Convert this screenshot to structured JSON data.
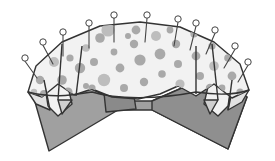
{
  "illustration": {
    "title": "Polka-dot fabric pinned over a folded board",
    "canvas": {
      "width": 275,
      "height": 161,
      "background": "#ffffff"
    },
    "palette": {
      "background": "#ffffff",
      "board_fill": "#a0a0a0",
      "board_shade_fill": "#8f8f8f",
      "cloth_fill": "#f2f2f2",
      "cloth_flap_fill": "#e2e2e2",
      "cloth_flap_dark_fill": "#cfcfcf",
      "dot_fill": "#a9a9a9",
      "dot_fill_light": "#bdbdbd",
      "tag_fill": "#8a8a8a",
      "outline": "#333333",
      "pin_head_fill": "#ffffff",
      "pin_stroke": "#444444"
    },
    "strokes": {
      "outline_width": 1.4,
      "pin_stem_width": 1.1,
      "pin_head_width": 1.0
    },
    "board": {
      "name": "dark-gray-chevron-board",
      "points": "33,95 60,74 117,101 152,101 214,74 247,97 228,149 152,110 118,110 49,151",
      "shade_points": "152,101 214,74 247,97 228,149 152,110"
    },
    "cloth": {
      "name": "polka-dot-cloth",
      "main_points": "28,92 36,66 62,42 100,26 140,22 180,27 214,42 240,64 249,90 232,98 214,84 196,96 178,86 160,94 138,99 112,97 92,89 74,95 58,84 42,97",
      "top_curve": "M 28,92 C 34,62 66,30 138,22 C 206,30 242,62 249,90",
      "hem_path": "M 28,92 C 52,98 66,96 92,92 C 118,100 160,99 196,92 C 222,96 238,94 249,90"
    },
    "flaps": [
      {
        "name": "flap-left-outer",
        "points": "28,92 44,82 50,110 36,104",
        "fill_key": "cloth_flap_fill"
      },
      {
        "name": "flap-left-point",
        "points": "44,80 66,78 72,104 58,116 48,106",
        "fill_key": "cloth_fill"
      },
      {
        "name": "flap-left-shadow",
        "points": "58,100 72,100 62,114",
        "fill_key": "cloth_flap_dark_fill"
      },
      {
        "name": "flap-right-outer",
        "points": "249,90 234,82 228,110 242,102",
        "fill_key": "cloth_flap_fill"
      },
      {
        "name": "flap-right-point",
        "points": "232,80 210,78 204,104 218,116 228,106",
        "fill_key": "cloth_fill"
      },
      {
        "name": "flap-right-shadow",
        "points": "204,100 218,100 210,114",
        "fill_key": "cloth_flap_dark_fill"
      }
    ],
    "center_tag": {
      "name": "center-dark-tag",
      "points": "104,93 133,90 136,109 106,112"
    },
    "fold_lines": [
      "M 44,80 L 50,110",
      "M 62,44 L 58,100",
      "M 232,80 L 228,110",
      "M 212,44 L 218,100",
      "M 196,46 L 196,94",
      "M 82,46 L 76,96"
    ],
    "dots": [
      {
        "cx": 54,
        "cy": 62,
        "r": 5.0
      },
      {
        "cx": 40,
        "cy": 80,
        "r": 4.2
      },
      {
        "cx": 62,
        "cy": 80,
        "r": 4.8
      },
      {
        "cx": 44,
        "cy": 94,
        "r": 4.0
      },
      {
        "cx": 70,
        "cy": 58,
        "r": 3.6
      },
      {
        "cx": 86,
        "cy": 48,
        "r": 3.8
      },
      {
        "cx": 80,
        "cy": 68,
        "r": 5.2
      },
      {
        "cx": 68,
        "cy": 92,
        "r": 4.6
      },
      {
        "cx": 94,
        "cy": 62,
        "r": 4.0
      },
      {
        "cx": 100,
        "cy": 38,
        "r": 4.8
      },
      {
        "cx": 104,
        "cy": 80,
        "r": 6.2
      },
      {
        "cx": 92,
        "cy": 88,
        "r": 3.6
      },
      {
        "cx": 114,
        "cy": 52,
        "r": 3.4
      },
      {
        "cx": 120,
        "cy": 68,
        "r": 4.4
      },
      {
        "cx": 124,
        "cy": 88,
        "r": 4.0
      },
      {
        "cx": 108,
        "cy": 30,
        "r": 6.6
      },
      {
        "cx": 134,
        "cy": 44,
        "r": 4.2
      },
      {
        "cx": 140,
        "cy": 60,
        "r": 5.6
      },
      {
        "cx": 144,
        "cy": 82,
        "r": 4.2
      },
      {
        "cx": 136,
        "cy": 30,
        "r": 4.4
      },
      {
        "cx": 156,
        "cy": 36,
        "r": 5.0
      },
      {
        "cx": 160,
        "cy": 54,
        "r": 5.4
      },
      {
        "cx": 162,
        "cy": 74,
        "r": 3.8
      },
      {
        "cx": 176,
        "cy": 44,
        "r": 4.2
      },
      {
        "cx": 178,
        "cy": 64,
        "r": 4.0
      },
      {
        "cx": 180,
        "cy": 84,
        "r": 4.6
      },
      {
        "cx": 194,
        "cy": 34,
        "r": 3.6
      },
      {
        "cx": 196,
        "cy": 56,
        "r": 4.4
      },
      {
        "cx": 200,
        "cy": 76,
        "r": 4.0
      },
      {
        "cx": 212,
        "cy": 46,
        "r": 3.6
      },
      {
        "cx": 214,
        "cy": 66,
        "r": 4.8
      },
      {
        "cx": 210,
        "cy": 88,
        "r": 4.2
      },
      {
        "cx": 228,
        "cy": 58,
        "r": 3.8
      },
      {
        "cx": 232,
        "cy": 76,
        "r": 4.4
      },
      {
        "cx": 240,
        "cy": 92,
        "r": 3.6
      },
      {
        "cx": 34,
        "cy": 92,
        "r": 3.2
      },
      {
        "cx": 86,
        "cy": 86,
        "r": 3.0
      },
      {
        "cx": 128,
        "cy": 36,
        "r": 3.0
      },
      {
        "cx": 170,
        "cy": 30,
        "r": 3.4
      },
      {
        "cx": 222,
        "cy": 88,
        "r": 3.4
      }
    ],
    "pins": [
      {
        "name": "pin-1",
        "head_cx": 25,
        "head_cy": 58,
        "head_r": 3.2,
        "stem_x2": 37,
        "stem_y2": 78
      },
      {
        "name": "pin-2",
        "head_cx": 43,
        "head_cy": 42,
        "head_r": 3.2,
        "stem_x2": 53,
        "stem_y2": 64
      },
      {
        "name": "pin-3",
        "head_cx": 63,
        "head_cy": 32,
        "head_r": 3.2,
        "stem_x2": 63,
        "stem_y2": 56
      },
      {
        "name": "pin-4",
        "head_cx": 89,
        "head_cy": 23,
        "head_r": 3.2,
        "stem_x2": 89,
        "stem_y2": 48
      },
      {
        "name": "pin-5",
        "head_cx": 114,
        "head_cy": 15,
        "head_r": 3.2,
        "stem_x2": 114,
        "stem_y2": 42
      },
      {
        "name": "pin-6",
        "head_cx": 147,
        "head_cy": 15,
        "head_r": 3.2,
        "stem_x2": 145,
        "stem_y2": 42
      },
      {
        "name": "pin-7",
        "head_cx": 178,
        "head_cy": 19,
        "head_r": 3.2,
        "stem_x2": 174,
        "stem_y2": 46
      },
      {
        "name": "pin-8",
        "head_cx": 196,
        "head_cy": 23,
        "head_r": 3.2,
        "stem_x2": 190,
        "stem_y2": 50
      },
      {
        "name": "pin-9",
        "head_cx": 215,
        "head_cy": 30,
        "head_r": 3.2,
        "stem_x2": 206,
        "stem_y2": 54
      },
      {
        "name": "pin-10",
        "head_cx": 235,
        "head_cy": 46,
        "head_r": 3.2,
        "stem_x2": 224,
        "stem_y2": 68
      },
      {
        "name": "pin-11",
        "head_cx": 248,
        "head_cy": 62,
        "head_r": 3.2,
        "stem_x2": 238,
        "stem_y2": 82
      }
    ]
  }
}
